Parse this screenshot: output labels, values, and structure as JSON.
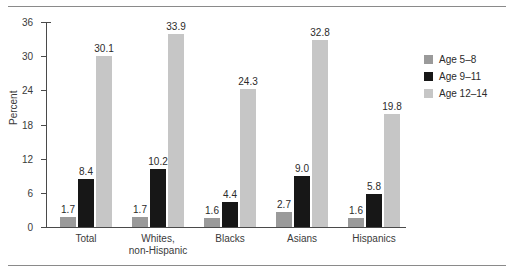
{
  "chart_data": {
    "type": "bar",
    "title": "",
    "subtitle": "",
    "xlabel": "",
    "ylabel": "Percent",
    "ylim": [
      0,
      36
    ],
    "yticks": [
      0,
      6,
      12,
      18,
      24,
      30,
      36
    ],
    "grid": false,
    "legend_position": "right",
    "categories": [
      "Total",
      "Whites,\nnon-Hispanic",
      "Blacks",
      "Asians",
      "Hispanics"
    ],
    "category_lines": [
      [
        "Total"
      ],
      [
        "Whites,",
        "non-Hispanic"
      ],
      [
        "Blacks"
      ],
      [
        "Asians"
      ],
      [
        "Hispanics"
      ]
    ],
    "series": [
      {
        "name": "Age 5–8",
        "color": "#9a9a9a",
        "values": [
          1.7,
          1.7,
          1.6,
          2.7,
          1.6
        ],
        "labels": [
          "1.7",
          "1.7",
          "1.6",
          "2.7",
          "1.6"
        ]
      },
      {
        "name": "Age 9–11",
        "color": "#171717",
        "values": [
          8.4,
          10.2,
          4.4,
          9.0,
          5.8
        ],
        "labels": [
          "8.4",
          "10.2",
          "4.4",
          "9.0",
          "5.8"
        ]
      },
      {
        "name": "Age 12–14",
        "color": "#c6c6c6",
        "values": [
          30.1,
          33.9,
          24.3,
          32.8,
          19.8
        ],
        "labels": [
          "30.1",
          "33.9",
          "24.3",
          "32.8",
          "19.8"
        ]
      }
    ]
  },
  "legend": {
    "items": [
      {
        "label": "Age 5–8",
        "color": "#9a9a9a"
      },
      {
        "label": "Age 9–11",
        "color": "#171717"
      },
      {
        "label": "Age 12–14",
        "color": "#c6c6c6"
      }
    ]
  },
  "axes": {
    "y_title": "Percent",
    "y_tick_labels": [
      "36",
      "30",
      "24",
      "18",
      "12",
      "6",
      "0"
    ]
  }
}
